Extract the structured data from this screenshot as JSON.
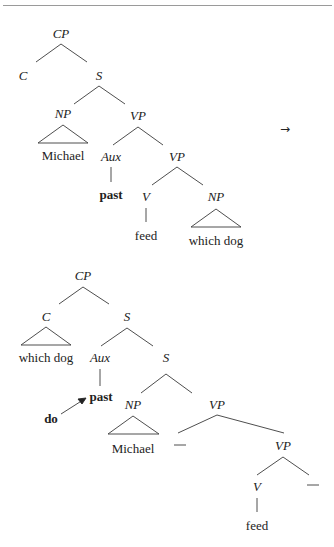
{
  "transform_arrow": "→",
  "tree1": {
    "name": "before-do-support",
    "nodes": {
      "cp": "CP",
      "c": "C",
      "s": "S",
      "np": "NP",
      "np_word": "Michael",
      "vp": "VP",
      "aux": "Aux",
      "aux_word": "past",
      "vp2": "VP",
      "v": "V",
      "v_word": "feed",
      "np2": "NP",
      "np2_word": "which dog"
    }
  },
  "tree2": {
    "name": "after-do-support",
    "nodes": {
      "cp": "CP",
      "c": "C",
      "c_word": "which dog",
      "s": "S",
      "aux": "Aux",
      "aux_word": "past",
      "do_word": "do",
      "s2": "S",
      "np": "NP",
      "np_word": "Michael",
      "vp": "VP",
      "trace1": "—",
      "vp2": "VP",
      "v": "V",
      "v_word": "feed",
      "trace2": "—"
    }
  }
}
